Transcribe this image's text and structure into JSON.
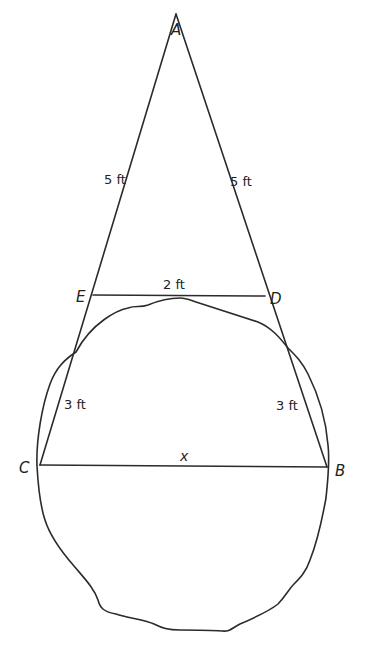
{
  "figure": {
    "vertices": {
      "A": "A",
      "B": "B",
      "C": "C",
      "D": "D",
      "E": "E"
    },
    "measurements": {
      "AE": "5 ft",
      "AD": "5 ft",
      "ED": "2 ft",
      "EC": "3 ft",
      "DB": "3 ft",
      "CB": "x"
    },
    "colors": {
      "stroke": "#2b2b2b",
      "text": "#222222",
      "background": "#ffffff"
    }
  }
}
